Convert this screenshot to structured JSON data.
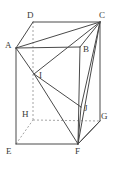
{
  "figure": {
    "type": "geometry-diagram",
    "canvas": {
      "width": 116,
      "height": 169
    },
    "colors": {
      "background": "#ffffff",
      "solid_edge": "#4a4a4a",
      "hidden_edge": "#9a9a9a",
      "label_text": "#3a3a3a"
    },
    "vertices": [
      {
        "id": "A",
        "label": "A",
        "x": 16,
        "y": 48,
        "label_x": 5,
        "label_y": 41,
        "hidden": false
      },
      {
        "id": "B",
        "label": "B",
        "x": 80,
        "y": 47,
        "label_x": 83,
        "label_y": 45,
        "hidden": false
      },
      {
        "id": "C",
        "label": "C",
        "x": 100,
        "y": 22,
        "label_x": 99,
        "label_y": 11,
        "hidden": false
      },
      {
        "id": "D",
        "label": "D",
        "x": 33,
        "y": 22,
        "label_x": 27,
        "label_y": 11,
        "hidden": false
      },
      {
        "id": "E",
        "label": "E",
        "x": 16,
        "y": 144,
        "label_x": 6,
        "label_y": 147,
        "hidden": false
      },
      {
        "id": "F",
        "label": "F",
        "x": 78,
        "y": 144,
        "label_x": 75,
        "label_y": 147,
        "hidden": false
      },
      {
        "id": "G",
        "label": "G",
        "x": 100,
        "y": 121,
        "label_x": 101,
        "label_y": 112,
        "hidden": false
      },
      {
        "id": "H",
        "label": "H",
        "x": 33,
        "y": 120,
        "label_x": 22,
        "label_y": 110,
        "hidden": true
      },
      {
        "id": "I",
        "label": "I",
        "x": 34,
        "y": 74,
        "label_x": 39,
        "label_y": 71,
        "hidden": false
      },
      {
        "id": "J",
        "label": "J",
        "x": 81,
        "y": 107,
        "label_x": 84,
        "label_y": 104,
        "hidden": false
      }
    ],
    "edges": [
      {
        "from": "A",
        "to": "D",
        "style": "solid"
      },
      {
        "from": "D",
        "to": "C",
        "style": "solid"
      },
      {
        "from": "A",
        "to": "B",
        "style": "solid"
      },
      {
        "from": "B",
        "to": "C",
        "style": "solid"
      },
      {
        "from": "A",
        "to": "C",
        "style": "solid"
      },
      {
        "from": "A",
        "to": "E",
        "style": "solid"
      },
      {
        "from": "B",
        "to": "F",
        "style": "solid"
      },
      {
        "from": "C",
        "to": "G",
        "style": "solid"
      },
      {
        "from": "D",
        "to": "H",
        "style": "hidden"
      },
      {
        "from": "E",
        "to": "F",
        "style": "solid"
      },
      {
        "from": "F",
        "to": "G",
        "style": "solid"
      },
      {
        "from": "E",
        "to": "H",
        "style": "hidden"
      },
      {
        "from": "H",
        "to": "G",
        "style": "hidden"
      },
      {
        "from": "A",
        "to": "I",
        "style": "solid"
      },
      {
        "from": "C",
        "to": "I",
        "style": "solid"
      },
      {
        "from": "I",
        "to": "J",
        "style": "solid"
      },
      {
        "from": "C",
        "to": "J",
        "style": "solid"
      },
      {
        "from": "I",
        "to": "F",
        "style": "solid"
      },
      {
        "from": "J",
        "to": "F",
        "style": "solid"
      },
      {
        "from": "C",
        "to": "F",
        "style": "solid"
      },
      {
        "from": "F",
        "to": "G",
        "style": "solid"
      }
    ],
    "labels": {
      "A": "A",
      "B": "B",
      "C": "C",
      "D": "D",
      "E": "E",
      "F": "F",
      "G": "G",
      "H": "H",
      "I": "I",
      "J": "J"
    }
  }
}
